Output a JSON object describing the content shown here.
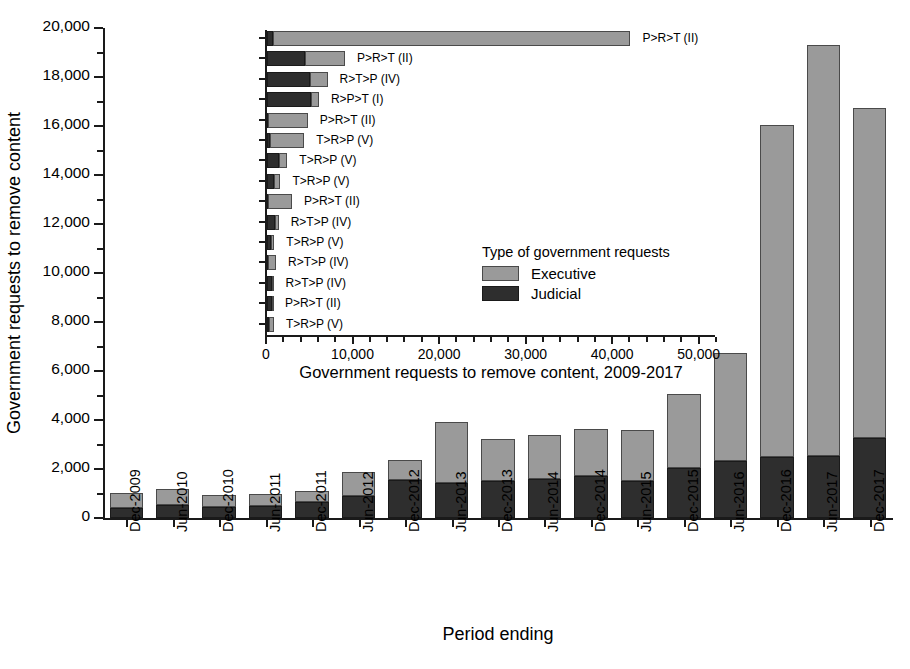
{
  "chart_data": [
    {
      "type": "bar",
      "id": "main",
      "title": "",
      "xlabel": "Period ending",
      "ylabel": "Government requests to remove content",
      "ylim": [
        0,
        20000
      ],
      "ytick_step": 2000,
      "ytick_labels": [
        "0",
        "2,000",
        "4,000",
        "6,000",
        "8,000",
        "10,000",
        "12,000",
        "14,000",
        "16,000",
        "18,000",
        "20,000"
      ],
      "stacked": true,
      "legend": [
        "Executive",
        "Judicial"
      ],
      "categories": [
        "Dec-2009",
        "Jun-2010",
        "Dec-2010",
        "Jun-2011",
        "Dec-2011",
        "Jun-2012",
        "Dec-2012",
        "Jun-2013",
        "Dec-2013",
        "Jun-2014",
        "Dec-2014",
        "Jun-2015",
        "Dec-2015",
        "Jun-2016",
        "Dec-2016",
        "Jun-2017",
        "Dec-2017"
      ],
      "series": [
        {
          "name": "Judicial",
          "values": [
            400,
            520,
            450,
            480,
            640,
            900,
            1540,
            1430,
            1530,
            1580,
            1700,
            1520,
            2050,
            2340,
            2500,
            2540,
            3280
          ]
        },
        {
          "name": "Executive",
          "values": [
            630,
            680,
            500,
            500,
            460,
            990,
            830,
            2490,
            1680,
            1820,
            1930,
            2090,
            3020,
            4380,
            13540,
            16760,
            13470
          ]
        }
      ],
      "totals": [
        1030,
        1200,
        950,
        980,
        1100,
        1890,
        2370,
        3920,
        3210,
        3400,
        3630,
        3610,
        5070,
        6720,
        16040,
        19300,
        16750
      ]
    },
    {
      "type": "bar",
      "id": "inset",
      "orientation": "horizontal",
      "title": "",
      "xlabel": "Government requests to remove content, 2009-2017",
      "ylabel": "",
      "xlim": [
        0,
        52000
      ],
      "xtick_step": 10000,
      "xtick_labels": [
        "0",
        "10,000",
        "20,000",
        "30,000",
        "40,000",
        "50,000"
      ],
      "stacked": true,
      "legend_title": "Type of government requests",
      "legend": [
        "Executive",
        "Judicial"
      ],
      "categories": [
        "Russian Federation",
        "Turkey",
        "United States",
        "Brazil",
        "India",
        "United Kingdom",
        "Germany",
        "France",
        "South Africa",
        "Italy",
        "Israel",
        "Spain",
        "Japan",
        "Argentina",
        "Canada"
      ],
      "series": [
        {
          "name": "Judicial",
          "values": [
            700,
            4400,
            5000,
            5100,
            100,
            350,
            1400,
            850,
            80,
            900,
            450,
            150,
            620,
            560,
            180
          ]
        },
        {
          "name": "Executive",
          "values": [
            41300,
            4600,
            2000,
            900,
            4600,
            3950,
            950,
            700,
            2800,
            450,
            400,
            900,
            130,
            120,
            620
          ]
        }
      ],
      "totals": [
        42000,
        9000,
        7000,
        6000,
        4700,
        4300,
        2350,
        1550,
        2880,
        1350,
        850,
        1050,
        750,
        680,
        800
      ],
      "annotations": [
        "P>R>T (II)",
        "P>R>T (II)",
        "R>T>P (IV)",
        "R>P>T (I)",
        "P>R>T (II)",
        "T>R>P (V)",
        "T>R>P (V)",
        "T>R>P (V)",
        "P>R>T (II)",
        "R>T>P (IV)",
        "T>R>P (V)",
        "R>T>P (IV)",
        "R>T>P (IV)",
        "P>R>T (II)",
        "T>R>P (V)"
      ]
    }
  ],
  "colors": {
    "executive": "#9a9a9a",
    "judicial": "#2e2e2e",
    "axis": "#1a1a1a",
    "background": "#ffffff"
  }
}
